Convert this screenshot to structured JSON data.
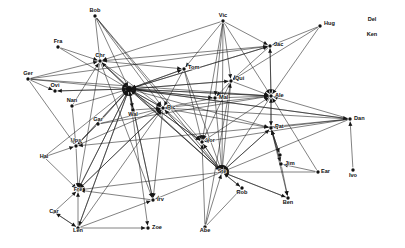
{
  "figure": {
    "title": "",
    "type": "directed-graph",
    "background_color": "#ffffff",
    "edge_color": "#1a1a1a",
    "node_color": "#111111",
    "label_color": "#111111",
    "width": 405,
    "height": 248
  },
  "chart_data": {
    "type": "diagram",
    "subtype": "directed network graph",
    "title": "",
    "directed": true,
    "node_count": 32,
    "edge_count": 120,
    "nodes": [
      {
        "id": "Bob",
        "label": "Bob",
        "x": 95,
        "y": 16,
        "anchor": "middle",
        "dx": 0,
        "dy": -5,
        "isolated": false
      },
      {
        "id": "Vic",
        "label": "Vic",
        "x": 223,
        "y": 21,
        "anchor": "middle",
        "dx": 0,
        "dy": -5,
        "isolated": false
      },
      {
        "id": "Hug",
        "label": "Hug",
        "x": 320,
        "y": 26,
        "anchor": "start",
        "dx": 4,
        "dy": -2,
        "isolated": false
      },
      {
        "id": "Del",
        "label": "Del",
        "x": 372,
        "y": 20,
        "anchor": "middle",
        "dx": 0,
        "dy": 0,
        "isolated": true
      },
      {
        "id": "Ken",
        "label": "Ken",
        "x": 372,
        "y": 35,
        "anchor": "middle",
        "dx": 0,
        "dy": 0,
        "isolated": true
      },
      {
        "id": "Fra",
        "label": "Fra",
        "x": 58,
        "y": 47,
        "anchor": "middle",
        "dx": 0,
        "dy": -5,
        "isolated": false
      },
      {
        "id": "Jac",
        "label": "Jac",
        "x": 270,
        "y": 46,
        "anchor": "start",
        "dx": 4,
        "dy": -1,
        "isolated": false
      },
      {
        "id": "Chr",
        "label": "Chr",
        "x": 100,
        "y": 61,
        "anchor": "middle",
        "dx": 0,
        "dy": -5,
        "isolated": false
      },
      {
        "id": "Tom",
        "label": "Tom",
        "x": 184,
        "y": 69,
        "anchor": "start",
        "dx": 4,
        "dy": -1,
        "isolated": false
      },
      {
        "id": "Ger",
        "label": "Ger",
        "x": 28,
        "y": 79,
        "anchor": "middle",
        "dx": 0,
        "dy": -5,
        "isolated": false
      },
      {
        "id": "Qui",
        "label": "Qui",
        "x": 231,
        "y": 81,
        "anchor": "start",
        "dx": 4,
        "dy": -2,
        "isolated": false
      },
      {
        "id": "Ovi",
        "label": "Ovi",
        "x": 55,
        "y": 91,
        "anchor": "middle",
        "dx": 0,
        "dy": -5,
        "isolated": false
      },
      {
        "id": "Hub",
        "label": "",
        "x": 129,
        "y": 89,
        "anchor": "middle",
        "dx": 0,
        "dy": 0,
        "isolated": false
      },
      {
        "id": "Mal",
        "label": "Mal",
        "x": 215,
        "y": 98,
        "anchor": "start",
        "dx": 4,
        "dy": 0,
        "isolated": false
      },
      {
        "id": "Ale",
        "label": "Ale",
        "x": 271,
        "y": 96,
        "anchor": "start",
        "dx": 4,
        "dy": 0,
        "isolated": false
      },
      {
        "id": "Nan",
        "label": "Nan",
        "x": 72,
        "y": 106,
        "anchor": "middle",
        "dx": 0,
        "dy": -5,
        "isolated": false
      },
      {
        "id": "Wal",
        "label": "Wal",
        "x": 133,
        "y": 110,
        "anchor": "middle",
        "dx": 0,
        "dy": 5,
        "isolated": false
      },
      {
        "id": "Ric",
        "label": "Ric",
        "x": 163,
        "y": 108,
        "anchor": "start",
        "dx": 4,
        "dy": 0,
        "isolated": false
      },
      {
        "id": "Dan",
        "label": "Dan",
        "x": 350,
        "y": 119,
        "anchor": "start",
        "dx": 4,
        "dy": 0,
        "isolated": false
      },
      {
        "id": "Gar",
        "label": "Gar",
        "x": 98,
        "y": 124,
        "anchor": "middle",
        "dx": 0,
        "dy": -4,
        "isolated": false
      },
      {
        "id": "Pat",
        "label": "Pat",
        "x": 271,
        "y": 128,
        "anchor": "start",
        "dx": 4,
        "dy": -1,
        "isolated": false
      },
      {
        "id": "Ups",
        "label": "Ups",
        "x": 76,
        "y": 146,
        "anchor": "middle",
        "dx": 0,
        "dy": -5,
        "isolated": false
      },
      {
        "id": "Vor",
        "label": "Vor",
        "x": 202,
        "y": 142,
        "anchor": "start",
        "dx": 4,
        "dy": -1,
        "isolated": false
      },
      {
        "id": "Hal",
        "label": "Hal",
        "x": 44,
        "y": 157,
        "anchor": "middle",
        "dx": 0,
        "dy": 0,
        "isolated": false
      },
      {
        "id": "Joh",
        "label": "",
        "x": 280,
        "y": 155,
        "anchor": "middle",
        "dx": 0,
        "dy": 0,
        "isolated": false
      },
      {
        "id": "Jim",
        "label": "Jim",
        "x": 281,
        "y": 164,
        "anchor": "start",
        "dx": 4,
        "dy": 0,
        "isolated": false
      },
      {
        "id": "Ste",
        "label": "Ste",
        "x": 222,
        "y": 172,
        "anchor": "middle",
        "dx": 0,
        "dy": 0,
        "isolated": false
      },
      {
        "id": "Ear",
        "label": "Ear",
        "x": 318,
        "y": 172,
        "anchor": "start",
        "dx": 3,
        "dy": 0,
        "isolated": false
      },
      {
        "id": "Ivo",
        "label": "Ivo",
        "x": 353,
        "y": 170,
        "anchor": "middle",
        "dx": 0,
        "dy": 6,
        "isolated": false
      },
      {
        "id": "Fre",
        "label": "Fre",
        "x": 78,
        "y": 190,
        "anchor": "middle",
        "dx": 0,
        "dy": 0,
        "isolated": false
      },
      {
        "id": "Rob",
        "label": "Rob",
        "x": 242,
        "y": 188,
        "anchor": "middle",
        "dx": 0,
        "dy": 5,
        "isolated": false
      },
      {
        "id": "Ben",
        "label": "Ben",
        "x": 288,
        "y": 198,
        "anchor": "middle",
        "dx": 0,
        "dy": 5,
        "isolated": false
      },
      {
        "id": "Irv",
        "label": "Irv",
        "x": 153,
        "y": 200,
        "anchor": "start",
        "dx": 4,
        "dy": 0,
        "isolated": false
      },
      {
        "id": "Car",
        "label": "Car",
        "x": 54,
        "y": 212,
        "anchor": "middle",
        "dx": 0,
        "dy": 0,
        "isolated": false
      },
      {
        "id": "Len",
        "label": "Len",
        "x": 78,
        "y": 228,
        "anchor": "middle",
        "dx": 0,
        "dy": 3,
        "isolated": false
      },
      {
        "id": "Zoe",
        "label": "Zoe",
        "x": 148,
        "y": 228,
        "anchor": "start",
        "dx": 4,
        "dy": 0,
        "isolated": false
      },
      {
        "id": "Abe",
        "label": "Abe",
        "x": 205,
        "y": 227,
        "anchor": "middle",
        "dx": 0,
        "dy": 4,
        "isolated": false
      }
    ],
    "edges": [
      {
        "from": "Bob",
        "to": "Chr"
      },
      {
        "from": "Bob",
        "to": "Hub"
      },
      {
        "from": "Bob",
        "to": "Ric"
      },
      {
        "from": "Bob",
        "to": "Ste"
      },
      {
        "from": "Bob",
        "to": "Vor"
      },
      {
        "from": "Fra",
        "to": "Chr"
      },
      {
        "from": "Fra",
        "to": "Hub"
      },
      {
        "from": "Ger",
        "to": "Chr"
      },
      {
        "from": "Ger",
        "to": "Ovi"
      },
      {
        "from": "Ger",
        "to": "Hub"
      },
      {
        "from": "Ger",
        "to": "Ale"
      },
      {
        "from": "Ger",
        "to": "Jac"
      },
      {
        "from": "Ger",
        "to": "Ups"
      },
      {
        "from": "Nan",
        "to": "Chr"
      },
      {
        "from": "Nan",
        "to": "Hub"
      },
      {
        "from": "Nan",
        "to": "Ups"
      },
      {
        "from": "Ovi",
        "to": "Hub"
      },
      {
        "from": "Chr",
        "to": "Hub"
      },
      {
        "from": "Chr",
        "to": "Ric"
      },
      {
        "from": "Chr",
        "to": "Tom"
      },
      {
        "from": "Chr",
        "to": "Ste"
      },
      {
        "from": "Chr",
        "to": "Irv"
      },
      {
        "from": "Chr",
        "to": "Fre"
      },
      {
        "from": "Hub",
        "to": "Chr"
      },
      {
        "from": "Hub",
        "to": "Ovi"
      },
      {
        "from": "Hub",
        "to": "Ric"
      },
      {
        "from": "Hub",
        "to": "Wal"
      },
      {
        "from": "Hub",
        "to": "Tom"
      },
      {
        "from": "Hub",
        "to": "Qui"
      },
      {
        "from": "Hub",
        "to": "Mal"
      },
      {
        "from": "Hub",
        "to": "Ale"
      },
      {
        "from": "Hub",
        "to": "Jac"
      },
      {
        "from": "Hub",
        "to": "Vor"
      },
      {
        "from": "Hub",
        "to": "Ste"
      },
      {
        "from": "Hub",
        "to": "Pat"
      },
      {
        "from": "Hub",
        "to": "Dan"
      },
      {
        "from": "Hub",
        "to": "Ups"
      },
      {
        "from": "Hub",
        "to": "Fre"
      },
      {
        "from": "Hub",
        "to": "Irv"
      },
      {
        "from": "Hub",
        "to": "Len"
      },
      {
        "from": "Hub",
        "to": "Zoe"
      },
      {
        "from": "Wal",
        "to": "Hub"
      },
      {
        "from": "Wal",
        "to": "Ric"
      },
      {
        "from": "Gar",
        "to": "Hub"
      },
      {
        "from": "Gar",
        "to": "Ric"
      },
      {
        "from": "Gar",
        "to": "Ale"
      },
      {
        "from": "Gar",
        "to": "Ups"
      },
      {
        "from": "Vic",
        "to": "Chr"
      },
      {
        "from": "Vic",
        "to": "Tom"
      },
      {
        "from": "Vic",
        "to": "Qui"
      },
      {
        "from": "Vic",
        "to": "Jac"
      },
      {
        "from": "Vic",
        "to": "Ale"
      },
      {
        "from": "Vic",
        "to": "Mal"
      },
      {
        "from": "Vic",
        "to": "Ste"
      },
      {
        "from": "Vic",
        "to": "Vor"
      },
      {
        "from": "Hug",
        "to": "Jac"
      },
      {
        "from": "Hug",
        "to": "Ale"
      },
      {
        "from": "Hug",
        "to": "Qui"
      },
      {
        "from": "Jac",
        "to": "Ale"
      },
      {
        "from": "Jac",
        "to": "Qui"
      },
      {
        "from": "Jac",
        "to": "Hub"
      },
      {
        "from": "Jac",
        "to": "Chr"
      },
      {
        "from": "Tom",
        "to": "Hub"
      },
      {
        "from": "Tom",
        "to": "Ric"
      },
      {
        "from": "Tom",
        "to": "Ste"
      },
      {
        "from": "Tom",
        "to": "Vor"
      },
      {
        "from": "Qui",
        "to": "Ale"
      },
      {
        "from": "Qui",
        "to": "Mal"
      },
      {
        "from": "Qui",
        "to": "Hub"
      },
      {
        "from": "Qui",
        "to": "Ste"
      },
      {
        "from": "Qui",
        "to": "Vor"
      },
      {
        "from": "Mal",
        "to": "Ale"
      },
      {
        "from": "Mal",
        "to": "Hub"
      },
      {
        "from": "Mal",
        "to": "Ric"
      },
      {
        "from": "Mal",
        "to": "Ste"
      },
      {
        "from": "Ric",
        "to": "Hub"
      },
      {
        "from": "Ric",
        "to": "Ale"
      },
      {
        "from": "Ric",
        "to": "Ste"
      },
      {
        "from": "Ric",
        "to": "Vor"
      },
      {
        "from": "Ric",
        "to": "Pat"
      },
      {
        "from": "Ric",
        "to": "Irv"
      },
      {
        "from": "Ric",
        "to": "Fre"
      },
      {
        "from": "Ale",
        "to": "Hub"
      },
      {
        "from": "Ale",
        "to": "Pat"
      },
      {
        "from": "Ale",
        "to": "Jac"
      },
      {
        "from": "Ale",
        "to": "Ste"
      },
      {
        "from": "Dan",
        "to": "Ale"
      },
      {
        "from": "Dan",
        "to": "Pat"
      },
      {
        "from": "Dan",
        "to": "Hub"
      },
      {
        "from": "Dan",
        "to": "Ric"
      },
      {
        "from": "Dan",
        "to": "Ups"
      },
      {
        "from": "Dan",
        "to": "Vor"
      },
      {
        "from": "Dan",
        "to": "Ste"
      },
      {
        "from": "Ivo",
        "to": "Dan"
      },
      {
        "from": "Pat",
        "to": "Ale"
      },
      {
        "from": "Pat",
        "to": "Jim"
      },
      {
        "from": "Pat",
        "to": "Joh"
      },
      {
        "from": "Pat",
        "to": "Ben"
      },
      {
        "from": "Pat",
        "to": "Ste"
      },
      {
        "from": "Ear",
        "to": "Ale"
      },
      {
        "from": "Ear",
        "to": "Jim"
      },
      {
        "from": "Ear",
        "to": "Ste"
      },
      {
        "from": "Jim",
        "to": "Ben"
      },
      {
        "from": "Jim",
        "to": "Pat"
      },
      {
        "from": "Joh",
        "to": "Pat"
      },
      {
        "from": "Vor",
        "to": "Ste"
      },
      {
        "from": "Vor",
        "to": "Hub"
      },
      {
        "from": "Vor",
        "to": "Ale"
      },
      {
        "from": "Ste",
        "to": "Hub"
      },
      {
        "from": "Ste",
        "to": "Ric"
      },
      {
        "from": "Ste",
        "to": "Vor"
      },
      {
        "from": "Ste",
        "to": "Rob"
      },
      {
        "from": "Ste",
        "to": "Ben"
      },
      {
        "from": "Ste",
        "to": "Pat"
      },
      {
        "from": "Ste",
        "to": "Irv"
      },
      {
        "from": "Ste",
        "to": "Fre"
      },
      {
        "from": "Rob",
        "to": "Ste"
      },
      {
        "from": "Abe",
        "to": "Ste"
      },
      {
        "from": "Abe",
        "to": "Vor"
      },
      {
        "from": "Abe",
        "to": "Rob"
      },
      {
        "from": "Abe",
        "to": "Qui"
      },
      {
        "from": "Ben",
        "to": "Ste"
      },
      {
        "from": "Hal",
        "to": "Fre"
      },
      {
        "from": "Hal",
        "to": "Ups"
      },
      {
        "from": "Hal",
        "to": "Hub"
      },
      {
        "from": "Ups",
        "to": "Fre"
      },
      {
        "from": "Ups",
        "to": "Hub"
      },
      {
        "from": "Ups",
        "to": "Ric"
      },
      {
        "from": "Car",
        "to": "Fre"
      },
      {
        "from": "Car",
        "to": "Len"
      },
      {
        "from": "Len",
        "to": "Fre"
      },
      {
        "from": "Len",
        "to": "Car"
      },
      {
        "from": "Len",
        "to": "Zoe"
      },
      {
        "from": "Len",
        "to": "Hub"
      },
      {
        "from": "Len",
        "to": "Ric"
      },
      {
        "from": "Len",
        "to": "Irv"
      },
      {
        "from": "Irv",
        "to": "Fre"
      },
      {
        "from": "Irv",
        "to": "Hub"
      },
      {
        "from": "Fre",
        "to": "Hub"
      },
      {
        "from": "Fre",
        "to": "Ric"
      }
    ]
  }
}
